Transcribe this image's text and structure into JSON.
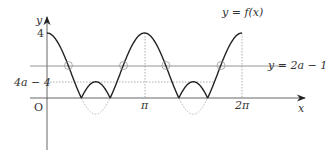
{
  "diagram": {
    "axes": {
      "y_label": "y",
      "x_label": "x",
      "origin_label": "O"
    },
    "y_ticks": [
      {
        "label": "4",
        "value": 4
      },
      {
        "label": "4a − 4",
        "value": 1
      }
    ],
    "x_ticks": [
      {
        "label": "π",
        "value": 3.14159
      },
      {
        "label": "2π",
        "value": 6.28318
      }
    ],
    "curve_label": "y = f(x)",
    "line_label": "y = 2a − 1",
    "line_value": 2,
    "intersection_count": 4,
    "colors": {
      "curve": "#222222",
      "axis": "#444444",
      "line": "#888888",
      "dotted": "#999999"
    }
  }
}
